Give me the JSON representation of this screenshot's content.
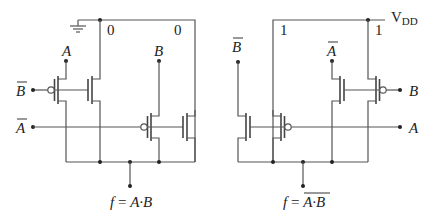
{
  "left_circuit": {
    "name": "Pass-transistor AND gate",
    "rail_label": "ground",
    "rail_values": [
      "0",
      "0"
    ],
    "inputs": {
      "a_top": "A",
      "b_top": "B",
      "b_bar_left": "B",
      "a_bar_left": "A"
    },
    "output_label": "f = A·B",
    "output_parts": {
      "f": "f",
      "eq": " = ",
      "expr": "A·B"
    }
  },
  "right_circuit": {
    "name": "Pass-transistor NAND gate",
    "rail_label": "V",
    "rail_label_sub": "DD",
    "rail_values": [
      "1",
      "1"
    ],
    "inputs": {
      "b_bar_top": "B",
      "a_bar_top": "A",
      "b_right": "B",
      "a_right": "A"
    },
    "output_label": "f = A·B (overlined)",
    "output_parts": {
      "f": "f",
      "eq": " = ",
      "expr": "A·B"
    }
  },
  "colors": {
    "wire": "#555555",
    "text": "#222222",
    "background": "#ffffff"
  }
}
